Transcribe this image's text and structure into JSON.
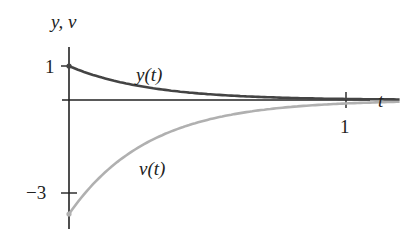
{
  "chart_data": {
    "type": "line",
    "title": "",
    "xlabel": "t",
    "ylabel": "y, v",
    "x_ticks": [
      {
        "value": 1,
        "label": "1"
      }
    ],
    "y_ticks": [
      {
        "value": 1,
        "label": "1"
      },
      {
        "value": -3,
        "label": "−3"
      }
    ],
    "xlim": [
      0,
      1.1
    ],
    "ylim": [
      -3.7,
      1.3
    ],
    "grid": false,
    "legend": "inline labels",
    "series": [
      {
        "name": "y(t)",
        "label": "y(t)",
        "color": "#444444",
        "formula": "e^(-3.5t)",
        "x": [
          0,
          0.1,
          0.2,
          0.3,
          0.4,
          0.5,
          0.6,
          0.7,
          0.8,
          0.9,
          1.0,
          1.1
        ],
        "values": [
          1.0,
          0.7,
          0.5,
          0.35,
          0.25,
          0.17,
          0.12,
          0.09,
          0.06,
          0.04,
          0.03,
          0.02
        ]
      },
      {
        "name": "v(t)",
        "label": "v(t)",
        "color": "#b0b0b0",
        "formula": "-3.5 e^(-3.5t)",
        "x": [
          0,
          0.1,
          0.2,
          0.3,
          0.4,
          0.5,
          0.6,
          0.7,
          0.8,
          0.9,
          1.0,
          1.1
        ],
        "values": [
          -3.5,
          -2.47,
          -1.74,
          -1.22,
          -0.86,
          -0.61,
          -0.43,
          -0.3,
          -0.21,
          -0.15,
          -0.11,
          -0.07
        ]
      }
    ],
    "markers": [
      {
        "series": "y(t)",
        "x": 0,
        "y": 1
      },
      {
        "series": "v(t)",
        "x": 0,
        "y": -3.5
      }
    ]
  },
  "labels": {
    "y_axis": "y, v",
    "x_axis": "t",
    "tick_y_1": "1",
    "tick_y_neg3": "−3",
    "tick_x_1": "1",
    "curve_y": "y(t)",
    "curve_v": "v(t)"
  },
  "colors": {
    "axis": "#222222",
    "y_curve": "#444444",
    "v_curve": "#b0b0b0"
  }
}
